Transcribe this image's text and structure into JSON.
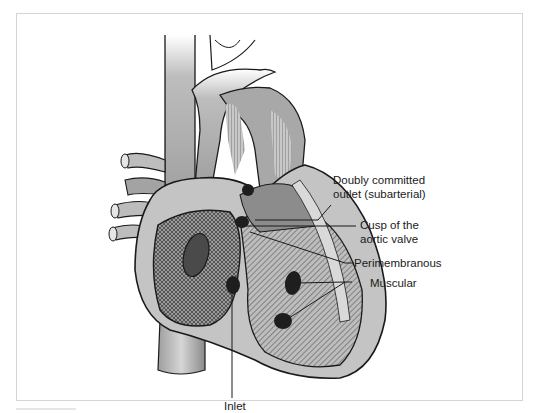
{
  "figure": {
    "labels": [
      {
        "id": "doubly-committed",
        "line1": "Doubly committed",
        "line2": "outlet (subarterial)"
      },
      {
        "id": "cusp",
        "line1": "Cusp of the",
        "line2": "aortic valve"
      },
      {
        "id": "perimembranous",
        "line1": "Perimembranous"
      },
      {
        "id": "muscular",
        "line1": "Muscular"
      },
      {
        "id": "inlet",
        "line1": "Inlet"
      }
    ],
    "colors": {
      "outline": "#1a1a1a",
      "tissue_light": "#d9d9d9",
      "tissue_mid": "#a8a8a8",
      "tissue_dark": "#6e6e6e",
      "hole": "#1e1e1e",
      "frame_border": "#d4d4d4"
    }
  }
}
